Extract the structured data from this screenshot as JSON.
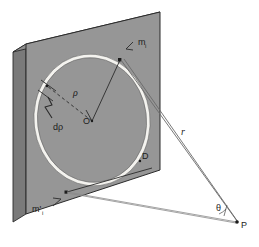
{
  "figure": {
    "type": "geometry-diagram"
  },
  "labels": {
    "mass_element_front": "m",
    "mass_element_front_sub": "i",
    "mass_element_back": "m'",
    "mass_element_back_sub": "i",
    "radius": "ρ",
    "radius_increment": "dρ",
    "center": "O",
    "point_d": "D",
    "distance": "r",
    "angle": "θ",
    "field_point": "P"
  },
  "colors": {
    "plate_face": "#969696",
    "plate_edge_left": "#6e6e6e",
    "plate_edge_top": "#7d7d7d",
    "plate_edge_dark": "#4a4a4a",
    "ring_fill": "#f2f2f0",
    "outline": "#2b2b2b",
    "ray": "#5d5d5d",
    "text": "#1c1c1c",
    "background": "#ffffff"
  },
  "geometry": {
    "plate_corners": {
      "top_left": [
        26,
        44
      ],
      "top_right": [
        160,
        12
      ],
      "bottom_right": [
        160,
        170
      ],
      "bottom_left": [
        26,
        214
      ]
    },
    "plate_thickness_px": 13,
    "ellipse_center": [
      92,
      120
    ],
    "ellipse_rx": 57,
    "ellipse_ry": 65,
    "ring_width_px": 4,
    "point_O": [
      92,
      121
    ],
    "point_D": [
      140,
      160
    ],
    "point_P": [
      237,
      222
    ],
    "mass_point_front": [
      120,
      60
    ],
    "mass_point_back": [
      66,
      192
    ],
    "dp_marker": [
      47,
      97
    ]
  }
}
